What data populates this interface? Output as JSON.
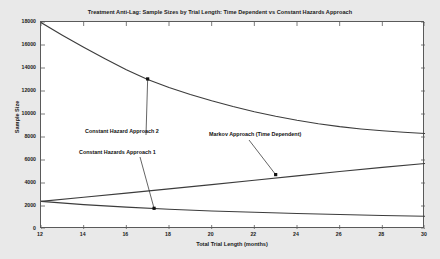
{
  "chart_data": {
    "type": "line",
    "title": "Treatment Anti-Lag: Sample Sizes by Trial Length: Time Dependent vs Constant Hazards Approach",
    "xlabel": "Total Trial Length (months)",
    "ylabel": "Sample Size",
    "xlim": [
      12,
      30
    ],
    "ylim": [
      0,
      18000
    ],
    "xticks": [
      12,
      14,
      16,
      18,
      20,
      22,
      24,
      26,
      28,
      30
    ],
    "yticks": [
      0,
      2000,
      4000,
      6000,
      8000,
      10000,
      12000,
      14000,
      16000,
      18000
    ],
    "grid": false,
    "legend": "annotations",
    "line_color": "#3c3c3c",
    "axes_color": "#5a5a5a",
    "plot_background": "#ffffff",
    "figure_background": "#e9e9e9",
    "series": [
      {
        "name": "Constant Hazard Approach 2",
        "x": [
          12,
          13,
          14,
          15,
          16,
          17,
          18,
          19,
          20,
          21,
          22,
          23,
          24,
          25,
          26,
          27,
          28,
          29,
          30
        ],
        "values": [
          17950,
          16850,
          15800,
          14800,
          13850,
          13000,
          12300,
          11700,
          11150,
          10650,
          10200,
          9800,
          9450,
          9150,
          8900,
          8700,
          8540,
          8410,
          8300
        ]
      },
      {
        "name": "Markov Approach (Time Dependent)",
        "x": [
          12,
          14,
          16,
          18,
          20,
          22,
          24,
          26,
          28,
          30
        ],
        "values": [
          2400,
          2760,
          3120,
          3490,
          3860,
          4240,
          4620,
          5000,
          5360,
          5700
        ]
      },
      {
        "name": "Constant Hazards Approach 1",
        "x": [
          12,
          14,
          16,
          18,
          20,
          22,
          24,
          26,
          28,
          30
        ],
        "values": [
          2400,
          2120,
          1900,
          1720,
          1570,
          1450,
          1350,
          1260,
          1180,
          1110
        ]
      }
    ],
    "annotations": [
      {
        "id": "constant-hazard-approach-2",
        "text": "Constant Hazard Approach 2",
        "point": [
          17.0,
          13050
        ]
      },
      {
        "id": "constant-hazards-approach-1",
        "text": "Constant Hazards Approach 1",
        "point": [
          17.3,
          1800
        ]
      },
      {
        "id": "markov-approach",
        "text": "Markov Approach (Time Dependent)",
        "point": [
          23.0,
          4730
        ]
      }
    ]
  }
}
